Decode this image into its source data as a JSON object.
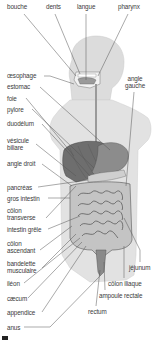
{
  "diagram": {
    "colors": {
      "body": "#dcdcdc",
      "body_outline": "#c4c4c4",
      "liver": "#6e6e6e",
      "stomach": "#8c8c8c",
      "intestine": "#bdbdbd",
      "intestine_outline": "#5a5a5a",
      "leader": "#555555",
      "text": "#3a3a3a"
    },
    "labels": {
      "bouche": "bouche",
      "dents": "dents",
      "langue": "langue",
      "pharynx": "pharynx",
      "oesophage": "œsophage",
      "angle_gauche_1": "angle",
      "angle_gauche_2": "gauche",
      "estomac": "estomac",
      "foie": "foie",
      "pylore": "pylore",
      "duodenum": "duodélum",
      "vesicule_1": "vésicule",
      "vesicule_2": "biliare",
      "angle_droit": "angle droit",
      "pancreas": "pancréas",
      "gros_intestin": "gros intestin",
      "colon_transverse_1": "côlon",
      "colon_transverse_2": "transverse",
      "intestin_grele": "intestin grêle",
      "colon_ascendant_1": "côlon",
      "colon_ascendant_2": "ascendant",
      "bandelette_1": "bandelette",
      "bandelette_2": "musculaire",
      "jejunum": "jéjunum",
      "ileon": "iléon",
      "colon_iliaque": "côlon iliaque",
      "caecum": "cæcum",
      "ampoule_rectale": "ampoule rectale",
      "appendice": "appendice",
      "rectum": "rectum",
      "anus": "anus"
    }
  }
}
